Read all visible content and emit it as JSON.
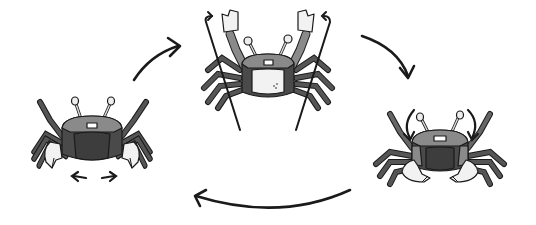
{
  "figure": {
    "colors": {
      "background": "#ffffff",
      "shell_dark": "#4a4a4a",
      "shell_mid": "#7a7a7a",
      "shell_light": "#a8a8a8",
      "claw": "#f2f2f2",
      "outline": "#1a1a1a"
    },
    "stages": [
      {
        "id": "stage-1",
        "pose": "claws-lowered",
        "motion": "lateral-arrows-below"
      },
      {
        "id": "stage-2",
        "pose": "claws-raised",
        "motion": "upward-arrows"
      },
      {
        "id": "stage-3",
        "pose": "claws-lowering",
        "motion": "downward-arrows"
      }
    ],
    "cycle_arrows": [
      {
        "from": "stage-1",
        "to": "stage-2"
      },
      {
        "from": "stage-2",
        "to": "stage-3"
      },
      {
        "from": "stage-3",
        "to": "stage-1"
      }
    ]
  }
}
